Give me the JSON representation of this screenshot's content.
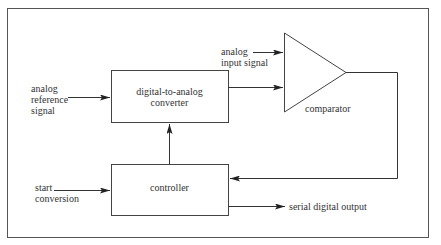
{
  "diagram": {
    "title": "",
    "blocks": {
      "dac": {
        "line1": "digital-to-analog",
        "line2": "converter"
      },
      "controller": {
        "label": "controller"
      },
      "comparator": {
        "label": "comparator"
      }
    },
    "signals": {
      "analog_reference": {
        "line1": "analog",
        "line2": "reference",
        "line3": "signal"
      },
      "analog_input": {
        "line1": "analog",
        "line2": "input signal"
      },
      "start_conversion": {
        "line1": "start",
        "line2": "conversion"
      },
      "serial_output": {
        "label": "serial digital output"
      }
    },
    "connections": [
      "analog reference signal -> digital-to-analog converter",
      "analog input signal -> comparator",
      "digital-to-analog converter -> comparator",
      "comparator -> controller",
      "controller -> digital-to-analog converter",
      "start conversion -> controller",
      "controller -> serial digital output"
    ],
    "colors": {
      "line": "#444444",
      "text": "#333333",
      "background": "#ffffff"
    }
  }
}
